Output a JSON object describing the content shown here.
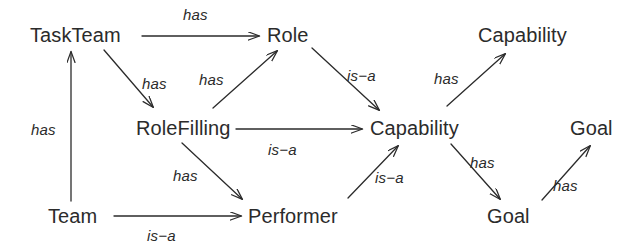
{
  "diagram": {
    "background_color": "#ffffff",
    "stroke_color": "#2b2b2b",
    "text_color": "#2b2b2b",
    "nodes": [
      {
        "id": "taskteam",
        "label": "TaskTeam",
        "x": 30,
        "y": 25
      },
      {
        "id": "role",
        "label": "Role",
        "x": 267,
        "y": 25
      },
      {
        "id": "capability_top",
        "label": "Capability",
        "x": 478,
        "y": 25
      },
      {
        "id": "rolefilling",
        "label": "RoleFilling",
        "x": 136,
        "y": 118
      },
      {
        "id": "capability_mid",
        "label": "Capability",
        "x": 370,
        "y": 118
      },
      {
        "id": "goal_right",
        "label": "Goal",
        "x": 570,
        "y": 118
      },
      {
        "id": "team",
        "label": "Team",
        "x": 48,
        "y": 206
      },
      {
        "id": "performer",
        "label": "Performer",
        "x": 248,
        "y": 206
      },
      {
        "id": "goal_bottom",
        "label": "Goal",
        "x": 487,
        "y": 206
      }
    ],
    "edges": [
      {
        "id": "e1",
        "from": "taskteam",
        "to": "role",
        "label": "has",
        "label_x": 183,
        "label_y": 7
      },
      {
        "id": "e2",
        "from": "team",
        "to": "taskteam",
        "label": "has",
        "label_x": 31,
        "label_y": 122
      },
      {
        "id": "e3",
        "from": "taskteam",
        "to": "rolefilling",
        "label": "has",
        "label_x": 142,
        "label_y": 76
      },
      {
        "id": "e4",
        "from": "rolefilling",
        "to": "role",
        "label": "has",
        "label_x": 199,
        "label_y": 72
      },
      {
        "id": "e5",
        "from": "role",
        "to": "capability_mid",
        "label": "is−a",
        "label_x": 347,
        "label_y": 68
      },
      {
        "id": "e6",
        "from": "rolefilling",
        "to": "capability_mid",
        "label": "is−a",
        "label_x": 268,
        "label_y": 142
      },
      {
        "id": "e7",
        "from": "rolefilling",
        "to": "performer",
        "label": "has",
        "label_x": 173,
        "label_y": 168
      },
      {
        "id": "e8",
        "from": "team",
        "to": "performer",
        "label": "is−a",
        "label_x": 147,
        "label_y": 228
      },
      {
        "id": "e9",
        "from": "performer",
        "to": "capability_mid",
        "label": "is−a",
        "label_x": 375,
        "label_y": 170
      },
      {
        "id": "e10",
        "from": "capability_mid",
        "to": "capability_top",
        "label": "has",
        "label_x": 434,
        "label_y": 71
      },
      {
        "id": "e11",
        "from": "capability_mid",
        "to": "goal_bottom",
        "label": "has",
        "label_x": 470,
        "label_y": 155
      },
      {
        "id": "e12",
        "from": "goal_bottom",
        "to": "goal_right",
        "label": "has",
        "label_x": 553,
        "label_y": 178
      }
    ],
    "lines": [
      {
        "id": "e1",
        "x1": 142,
        "y1": 36,
        "x2": 259,
        "y2": 36
      },
      {
        "id": "e2",
        "x1": 71,
        "y1": 201,
        "x2": 71,
        "y2": 52
      },
      {
        "id": "e3",
        "x1": 104,
        "y1": 50,
        "x2": 153,
        "y2": 107
      },
      {
        "id": "e4",
        "x1": 213,
        "y1": 108,
        "x2": 277,
        "y2": 51
      },
      {
        "id": "e5",
        "x1": 312,
        "y1": 48,
        "x2": 379,
        "y2": 110
      },
      {
        "id": "e6",
        "x1": 236,
        "y1": 129,
        "x2": 362,
        "y2": 129
      },
      {
        "id": "e7",
        "x1": 182,
        "y1": 143,
        "x2": 242,
        "y2": 199
      },
      {
        "id": "e8",
        "x1": 114,
        "y1": 216,
        "x2": 241,
        "y2": 216
      },
      {
        "id": "e9",
        "x1": 348,
        "y1": 198,
        "x2": 398,
        "y2": 146
      },
      {
        "id": "e10",
        "x1": 447,
        "y1": 106,
        "x2": 505,
        "y2": 54
      },
      {
        "id": "e11",
        "x1": 451,
        "y1": 144,
        "x2": 500,
        "y2": 199
      },
      {
        "id": "e12",
        "x1": 542,
        "y1": 200,
        "x2": 590,
        "y2": 146
      }
    ]
  }
}
